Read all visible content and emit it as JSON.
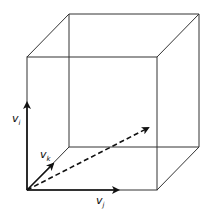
{
  "diagram": {
    "title": "",
    "cube": {
      "front_top_left": [
        27,
        57
      ],
      "front_top_right": [
        157,
        57
      ],
      "front_bottom_left": [
        27,
        190
      ],
      "front_bottom_right": [
        157,
        190
      ],
      "back_top_left": [
        69,
        14
      ],
      "back_top_right": [
        199,
        14
      ],
      "back_bottom_left": [
        69,
        147
      ],
      "back_bottom_right": [
        199,
        147
      ]
    },
    "vectors": [
      {
        "name": "v_i",
        "label": "v",
        "subscript": "i",
        "from": [
          27,
          190
        ],
        "arrow_at": [
          27,
          103
        ],
        "style": "solid"
      },
      {
        "name": "v_k",
        "label": "v",
        "subscript": "k",
        "from": [
          27,
          190
        ],
        "arrow_at": [
          53,
          164
        ],
        "style": "solid"
      },
      {
        "name": "v_j",
        "label": "v",
        "subscript": "j",
        "from": [
          27,
          190
        ],
        "arrow_at": [
          118,
          190
        ],
        "style": "solid"
      },
      {
        "name": "resultant",
        "label": "",
        "from": [
          27,
          190
        ],
        "arrow_at": [
          148,
          128
        ],
        "style": "dashed"
      }
    ],
    "labels": {
      "vi": "v",
      "vi_sub": "i",
      "vk": "v",
      "vk_sub": "k",
      "vj": "v",
      "vj_sub": "j"
    },
    "colors": {
      "line": "#222222",
      "background": "#ffffff"
    }
  }
}
